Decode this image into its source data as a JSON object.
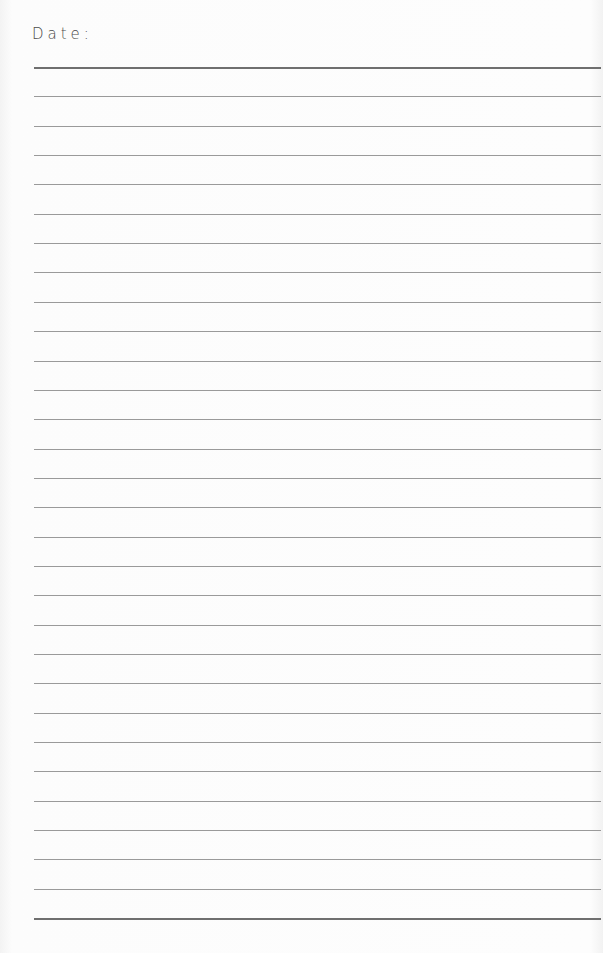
{
  "header": {
    "date_label": "Date:"
  },
  "ruled_lines": {
    "count": 30,
    "first_y": 67,
    "spacing": 29.35,
    "color": "#9a9a9a",
    "heavy_color": "#6f6f6f"
  }
}
